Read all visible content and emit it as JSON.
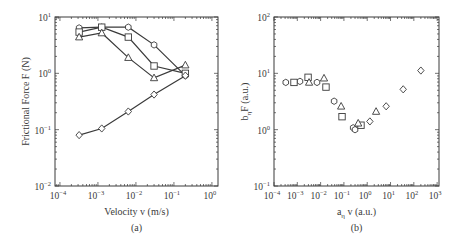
{
  "chart_data": [
    {
      "panel": "(a)",
      "type": "line",
      "title": "",
      "xlabel": "Velocity v (m/s)",
      "ylabel": "Frictional Force F (N)",
      "xscale": "log",
      "yscale": "log",
      "xlim": [
        7.4e-05,
        1.45
      ],
      "ylim": [
        0.01,
        10
      ],
      "xticks": [
        {
          "exp": "-4",
          "value": 0.0001
        },
        {
          "exp": "-3",
          "value": 0.001
        },
        {
          "exp": "-2",
          "value": 0.01
        },
        {
          "exp": "-1",
          "value": 0.1
        },
        {
          "exp": "0",
          "value": 1
        }
      ],
      "yticks": [
        {
          "exp": "-2",
          "value": 0.01
        },
        {
          "exp": "-1",
          "value": 0.1
        },
        {
          "exp": "0",
          "value": 1
        },
        {
          "exp": "1",
          "value": 10
        }
      ],
      "grid": false,
      "legend": null,
      "x": [
        0.00032,
        0.00126,
        0.0063,
        0.03,
        0.2
      ],
      "series": [
        {
          "name": "hexagon",
          "marker": "hexagon",
          "values": [
            6.4,
            6.6,
            6.6,
            3.2,
            0.91
          ]
        },
        {
          "name": "square",
          "marker": "square",
          "values": [
            5.4,
            6.6,
            4.4,
            1.35,
            1.0
          ]
        },
        {
          "name": "triangle",
          "marker": "triangle",
          "values": [
            4.4,
            5.2,
            1.9,
            0.83,
            1.4
          ]
        },
        {
          "name": "diamond",
          "marker": "diamond",
          "values": [
            0.08,
            0.105,
            0.21,
            0.42,
            0.91
          ]
        }
      ],
      "caption": "(a)"
    },
    {
      "panel": "(b)",
      "type": "scatter",
      "title": "",
      "xlabel_main": "a",
      "xlabel_sub": "η",
      "xlabel_rest": " v (a.u.)",
      "ylabel_main": "b",
      "ylabel_sub": "η",
      "ylabel_rest": "F (a.u.)",
      "xscale": "log",
      "yscale": "log",
      "xlim": [
        0.0001,
        1200
      ],
      "ylim": [
        0.1,
        100
      ],
      "xticks": [
        {
          "exp": "-4",
          "value": 0.0001
        },
        {
          "exp": "-3",
          "value": 0.001
        },
        {
          "exp": "-2",
          "value": 0.01
        },
        {
          "exp": "-1",
          "value": 0.1
        },
        {
          "exp": "0",
          "value": 1
        },
        {
          "exp": "1",
          "value": 10
        },
        {
          "exp": "2",
          "value": 100
        },
        {
          "exp": "3",
          "value": 1000
        }
      ],
      "yticks": [
        {
          "exp": "-1",
          "value": 0.1
        },
        {
          "exp": "0",
          "value": 1
        },
        {
          "exp": "1",
          "value": 10
        },
        {
          "exp": "2",
          "value": 100
        }
      ],
      "grid": false,
      "legend": null,
      "series": [
        {
          "name": "hexagon",
          "marker": "hexagon",
          "points": [
            [
              0.00032,
              6.9
            ],
            [
              0.0013,
              7.2
            ],
            [
              0.007,
              6.9
            ],
            [
              0.038,
              3.2
            ],
            [
              0.25,
              1.08
            ],
            [
              0.3,
              1.0
            ]
          ]
        },
        {
          "name": "square",
          "marker": "square",
          "points": [
            [
              0.00072,
              6.9
            ],
            [
              0.0029,
              8.5
            ],
            [
              0.017,
              5.7
            ],
            [
              0.083,
              1.7
            ],
            [
              0.54,
              1.2
            ]
          ]
        },
        {
          "name": "triangle",
          "marker": "triangle",
          "points": [
            [
              0.0032,
              6.9
            ],
            [
              0.014,
              8.2
            ],
            [
              0.076,
              2.6
            ],
            [
              0.41,
              1.3
            ],
            [
              2.4,
              2.1
            ]
          ]
        },
        {
          "name": "diamond",
          "marker": "diamond",
          "points": [
            [
              1.3,
              1.4
            ],
            [
              6.5,
              2.6
            ],
            [
              35,
              5.2
            ],
            [
              200,
              11.2
            ]
          ]
        }
      ],
      "caption": "(b)"
    }
  ],
  "style": {
    "frame_color": "#3a3a3a",
    "line_color": "#3a3a3a",
    "marker_fill": "#ffffff",
    "text_color": "#3a3a3a"
  }
}
